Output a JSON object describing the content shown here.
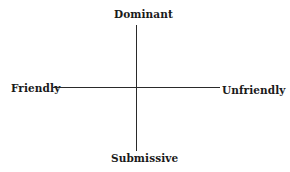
{
  "diagram": {
    "type": "two-axis quadrant",
    "axes": {
      "vertical": {
        "top_label": "Dominant",
        "bottom_label": "Submissive"
      },
      "horizontal": {
        "left_label": "Friendly",
        "right_label": "Unfriendly"
      }
    },
    "colors": {
      "line": "#2a2a2a",
      "text": "#1a1a1a",
      "background": "#ffffff"
    }
  }
}
